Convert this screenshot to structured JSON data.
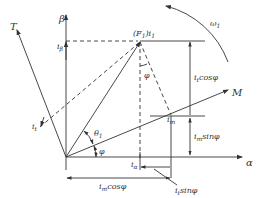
{
  "diagram": {
    "type": "phasor / space-vector diagram",
    "axes": {
      "alpha_label": "α",
      "beta_label": "β",
      "T_axis_label": "T",
      "M_axis_label": "M"
    },
    "vectors": {
      "resultant_label": "(F",
      "resultant_sub": "1",
      "resultant_suffix": ")i",
      "resultant_sub2": "1",
      "i_beta_label": "i",
      "i_beta_sub": "β",
      "i_alpha_label": "i",
      "i_alpha_sub": "α",
      "i_t_label": "i",
      "i_t_sub": "t",
      "i_m_label": "i",
      "i_m_sub": "m"
    },
    "angles": {
      "theta_label": "θ",
      "theta_sub": "1",
      "phi_label": "φ",
      "phi_top_label": "φ"
    },
    "rotation": {
      "omega_label": "ω",
      "omega_sub": "1"
    },
    "dimensions": {
      "it_cos_prefix": "i",
      "it_cos_sub": "t",
      "it_cos_suffix": "cosφ",
      "im_sin_prefix": "i",
      "im_sin_sub": "m",
      "im_sin_suffix": "sinφ",
      "im_cos_prefix": "i",
      "im_cos_sub": "m",
      "im_cos_suffix": "cosφ",
      "it_sin_prefix": "i",
      "it_sin_sub": "t",
      "it_sin_suffix": "sinφ"
    },
    "colors": {
      "line": "#333333",
      "background": "#ffffff"
    }
  }
}
